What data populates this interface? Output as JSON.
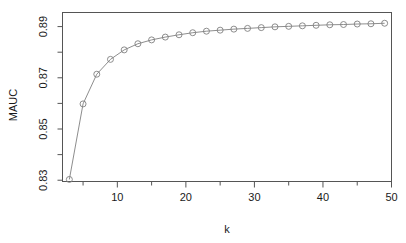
{
  "chart_data": {
    "type": "line",
    "title": "",
    "subtitle": "",
    "xlabel": "k",
    "ylabel": "MAUC",
    "xlim": [
      2,
      50
    ],
    "ylim": [
      0.8295,
      0.8955
    ],
    "grid": false,
    "legend": null,
    "marker": "open-circle",
    "line_color": "#808080",
    "marker_color": "#808080",
    "axis_color": "#555555",
    "x_ticks": [
      10,
      20,
      30,
      40,
      50
    ],
    "x_tick_labels": [
      "10",
      "20",
      "30",
      "40",
      "50"
    ],
    "x_minor_ticks": [
      5,
      15,
      25,
      35,
      45
    ],
    "y_ticks": [
      0.83,
      0.85,
      0.87,
      0.89
    ],
    "y_tick_labels": [
      "0.83",
      "0.85",
      "0.87",
      "0.89"
    ],
    "y_minor_ticks": [
      0.84,
      0.86,
      0.88
    ],
    "x": [
      3,
      5,
      7,
      9,
      11,
      13,
      15,
      17,
      19,
      21,
      23,
      25,
      27,
      29,
      31,
      33,
      35,
      37,
      39,
      41,
      43,
      45,
      47,
      49
    ],
    "values": [
      0.8303,
      0.8598,
      0.8714,
      0.8772,
      0.8809,
      0.8833,
      0.8848,
      0.8859,
      0.8868,
      0.8876,
      0.8882,
      0.8886,
      0.889,
      0.8893,
      0.8896,
      0.8899,
      0.8901,
      0.8903,
      0.8905,
      0.8907,
      0.8908,
      0.891,
      0.8911,
      0.8913
    ],
    "series": [
      {
        "name": "MAUC",
        "x": [
          3,
          5,
          7,
          9,
          11,
          13,
          15,
          17,
          19,
          21,
          23,
          25,
          27,
          29,
          31,
          33,
          35,
          37,
          39,
          41,
          43,
          45,
          47,
          49
        ],
        "values": [
          0.8303,
          0.8598,
          0.8714,
          0.8772,
          0.8809,
          0.8833,
          0.8848,
          0.8859,
          0.8868,
          0.8876,
          0.8882,
          0.8886,
          0.889,
          0.8893,
          0.8896,
          0.8899,
          0.8901,
          0.8903,
          0.8905,
          0.8907,
          0.8908,
          0.891,
          0.8911,
          0.8913
        ]
      }
    ]
  }
}
